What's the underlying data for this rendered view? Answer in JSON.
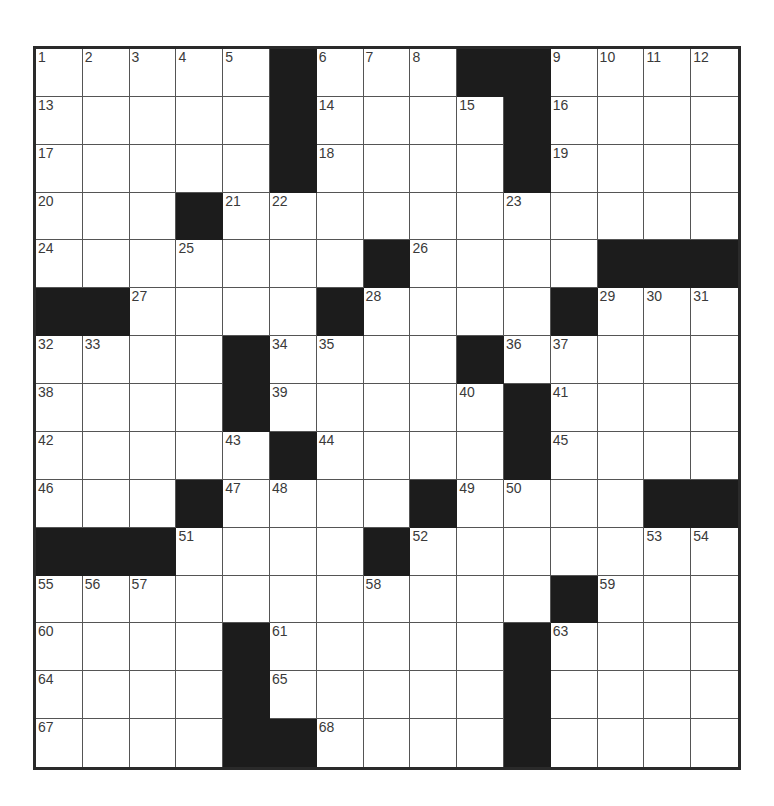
{
  "puzzle": {
    "rows": 15,
    "cols": 15,
    "colors": {
      "block": "#1c1c1c",
      "cell": "#ffffff",
      "border": "#2a2a2a",
      "number": "#3a3a3a"
    },
    "layout": [
      ".....#...##....",
      ".....#....#....",
      ".....#....#....",
      "...#...........",
      ".......#....###",
      "##....#....#...",
      "....#....#.....",
      "....#.....#....",
      ".....#....#....",
      "...#....#....##",
      "###....#.......",
      "...........#...",
      "....#.....#....",
      "....#.....#....",
      "....##....#...."
    ],
    "numbers": {
      "0,0": "1",
      "0,1": "2",
      "0,2": "3",
      "0,3": "4",
      "0,4": "5",
      "0,6": "6",
      "0,7": "7",
      "0,8": "8",
      "0,11": "9",
      "0,12": "10",
      "0,13": "11",
      "0,14": "12",
      "1,0": "13",
      "1,6": "14",
      "1,9": "15",
      "1,11": "16",
      "2,0": "17",
      "2,6": "18",
      "2,11": "19",
      "3,0": "20",
      "3,4": "21",
      "3,5": "22",
      "3,10": "23",
      "4,0": "24",
      "4,3": "25",
      "4,8": "26",
      "5,2": "27",
      "5,7": "28",
      "5,12": "29",
      "5,13": "30",
      "5,14": "31",
      "6,0": "32",
      "6,1": "33",
      "6,5": "34",
      "6,6": "35",
      "6,10": "36",
      "6,11": "37",
      "7,0": "38",
      "7,5": "39",
      "7,9": "40",
      "7,11": "41",
      "8,0": "42",
      "8,4": "43",
      "8,6": "44",
      "8,11": "45",
      "9,0": "46",
      "9,4": "47",
      "9,5": "48",
      "9,9": "49",
      "9,10": "50",
      "10,3": "51",
      "10,8": "52",
      "10,13": "53",
      "10,14": "54",
      "11,0": "55",
      "11,1": "56",
      "11,2": "57",
      "11,7": "58",
      "11,12": "59",
      "12,0": "60",
      "12,5": "61",
      "12,10": "62",
      "12,11": "63",
      "13,0": "64",
      "13,5": "65",
      "13,10": "66",
      "14,0": "67",
      "14,6": "68",
      "14,10": "69"
    }
  }
}
